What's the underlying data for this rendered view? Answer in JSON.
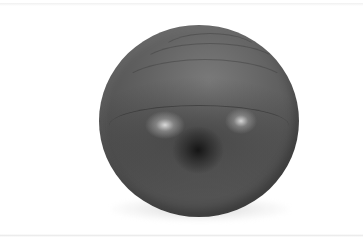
{
  "image": {
    "subject": "exercise-ball",
    "description": "Dark gray inflatable exercise ball on a white background",
    "colors": {
      "background": "#ffffff",
      "ball_base": "#5a5a5a",
      "ball_dark": "#1a1a1a",
      "highlight": "#dcdcdc"
    }
  }
}
